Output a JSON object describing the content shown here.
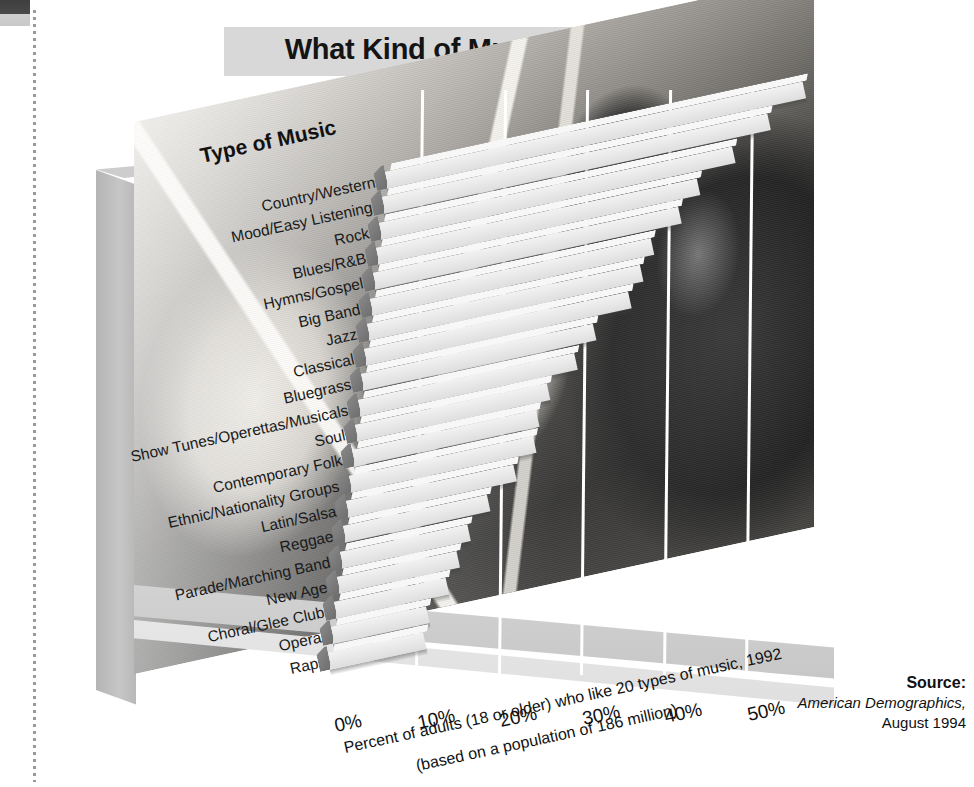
{
  "title": "What Kind of Music Do You Like?",
  "axis_title": "Type of Music",
  "caption_line1": "Percent of adults (18 or older) who like 20 types of music, 1992",
  "caption_line2": "(based on a population of 186 million)",
  "source": {
    "label": "Source:",
    "line1": "American Demographics,",
    "line2": "August 1994"
  },
  "colors": {
    "bar_face": "#e9e9e9",
    "bar_side": "#7f7f7f",
    "banner": "#d8d8d8",
    "slab": "#c6c6c6",
    "gridline": "#ffffff",
    "text": "#111111"
  },
  "chart_data": {
    "type": "bar",
    "orientation": "horizontal",
    "title": "What Kind of Music Do You Like?",
    "xlabel": "Percent of adults (18 or older) who like 20 types of music, 1992 (based on a population of 186 million)",
    "ylabel": "Type of Music",
    "xlim": [
      0,
      55
    ],
    "xticks": [
      0,
      10,
      20,
      30,
      40,
      50
    ],
    "xtick_labels": [
      "0%",
      "10%",
      "20%",
      "30%",
      "40%",
      "50%"
    ],
    "grid": true,
    "legend": false,
    "categories": [
      "Country/Western",
      "Mood/Easy Listening",
      "Rock",
      "Blues/R&B",
      "Hymns/Gospel",
      "Big Band",
      "Jazz",
      "Classical",
      "Bluegrass",
      "Show Tunes/Operettas/Musicals",
      "Soul",
      "Contemporary Folk",
      "Ethnic/Nationality Groups",
      "Latin/Salsa",
      "Reggae",
      "Parade/Marching Band",
      "New Age",
      "Choral/Glee Club",
      "Opera",
      "Rap"
    ],
    "values": [
      52,
      48,
      44,
      40,
      38,
      35,
      34,
      33,
      29,
      27,
      24,
      23,
      23,
      21,
      18,
      16,
      15,
      14,
      12,
      12
    ]
  }
}
